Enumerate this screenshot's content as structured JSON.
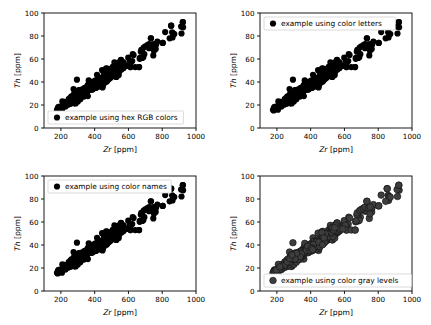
{
  "figure": {
    "background": "#ffffff",
    "layout": "2x2 grid of scatter subplots",
    "width": 431,
    "height": 325
  },
  "chart_data": [
    {
      "type": "scatter",
      "position": "top-left",
      "title": "",
      "xlabel": "Zr [ppm]",
      "ylabel": "Th [ppm]",
      "xlabel_symbol": "Zr",
      "xlabel_unit": "[ppm]",
      "ylabel_symbol": "Th",
      "ylabel_unit": "[ppm]",
      "xlim": [
        100,
        1000
      ],
      "ylim": [
        0,
        100
      ],
      "xticks": [
        200,
        400,
        600,
        800,
        1000
      ],
      "yticks": [
        0,
        20,
        40,
        60,
        80,
        100
      ],
      "grid": false,
      "legend": {
        "entries": [
          "example using hex RGB colors"
        ],
        "position": "lower left",
        "marker": "circle"
      },
      "marker": {
        "shape": "circle",
        "facecolor": "#000000",
        "edgecolor": "#000000",
        "size": 4.2,
        "alpha": 1.0
      }
    },
    {
      "type": "scatter",
      "position": "top-right",
      "title": "",
      "xlabel": "Zr [ppm]",
      "ylabel": "Th [ppm]",
      "xlabel_symbol": "Zr",
      "xlabel_unit": "[ppm]",
      "ylabel_symbol": "Th",
      "ylabel_unit": "[ppm]",
      "xlim": [
        100,
        1000
      ],
      "ylim": [
        0,
        100
      ],
      "xticks": [
        200,
        400,
        600,
        800,
        1000
      ],
      "yticks": [
        0,
        20,
        40,
        60,
        80,
        100
      ],
      "grid": false,
      "legend": {
        "entries": [
          "example using color letters"
        ],
        "position": "upper left",
        "marker": "circle"
      },
      "marker": {
        "shape": "circle",
        "facecolor": "#000000",
        "edgecolor": "#000000",
        "size": 4.2,
        "alpha": 1.0
      }
    },
    {
      "type": "scatter",
      "position": "bottom-left",
      "title": "",
      "xlabel": "Zr [ppm]",
      "ylabel": "Th [ppm]",
      "xlabel_symbol": "Zr",
      "xlabel_unit": "[ppm]",
      "ylabel_symbol": "Th",
      "ylabel_unit": "[ppm]",
      "xlim": [
        100,
        1000
      ],
      "ylim": [
        0,
        100
      ],
      "xticks": [
        200,
        400,
        600,
        800,
        1000
      ],
      "yticks": [
        0,
        20,
        40,
        60,
        80,
        100
      ],
      "grid": false,
      "legend": {
        "entries": [
          "example using color names"
        ],
        "position": "upper left",
        "marker": "circle"
      },
      "marker": {
        "shape": "circle",
        "facecolor": "#000000",
        "edgecolor": "#000000",
        "size": 4.2,
        "alpha": 1.0
      }
    },
    {
      "type": "scatter",
      "position": "bottom-right",
      "title": "",
      "xlabel": "Zr [ppm]",
      "ylabel": "Th [ppm]",
      "xlabel_symbol": "Zr",
      "xlabel_unit": "[ppm]",
      "ylabel_symbol": "Th",
      "ylabel_unit": "[ppm]",
      "xlim": [
        100,
        1000
      ],
      "ylim": [
        0,
        100
      ],
      "xticks": [
        200,
        400,
        600,
        800,
        1000
      ],
      "yticks": [
        0,
        20,
        40,
        60,
        80,
        100
      ],
      "grid": false,
      "legend": {
        "entries": [
          "example using color gray levels"
        ],
        "position": "lower left",
        "marker": "circle"
      },
      "marker": {
        "shape": "circle",
        "facecolor": "#3d3d3d",
        "edgecolor": "#111111",
        "size": 4.6,
        "alpha": 1.0
      }
    }
  ],
  "shared_dataset": {
    "description": "Zr vs Th geochemical data, identical in all four subplots",
    "n_points": 312,
    "x_range": [
      176,
      922
    ],
    "y_range": [
      16,
      92
    ],
    "trend": "positive linear, Th = 0.1 * Zr - 1.5 approximately",
    "dense_cluster_x_range": [
      176,
      560
    ],
    "sparse_tail_x_range": [
      560,
      922
    ],
    "notable_points": [
      {
        "x": 295,
        "y": 42,
        "note": "isolated outlier above main trend"
      },
      {
        "x": 612,
        "y": 53,
        "note": "flat pair"
      },
      {
        "x": 663,
        "y": 53,
        "note": "flat pair"
      },
      {
        "x": 733,
        "y": 78,
        "note": "high point"
      },
      {
        "x": 803,
        "y": 74
      },
      {
        "x": 853,
        "y": 89
      },
      {
        "x": 922,
        "y": 92,
        "note": "maximum"
      }
    ]
  },
  "style": {
    "axis_color": "#000000",
    "tick_color": "#000000",
    "frame_color": "#000000",
    "legend_frame_color": "#cccccc",
    "legend_face_color": "#ffffff"
  }
}
